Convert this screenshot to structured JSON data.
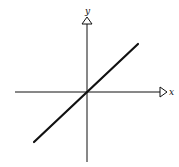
{
  "diagram": {
    "type": "cartesian-axes-with-line",
    "x_axis_label": "x",
    "y_axis_label": "y",
    "line": {
      "description": "straight line through the origin with positive slope",
      "passes_through_origin": true,
      "slope_sign": "positive"
    },
    "colors": {
      "background": "#ffffff",
      "stroke": "#111111"
    }
  }
}
